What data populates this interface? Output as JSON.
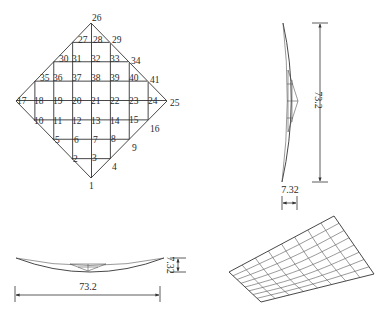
{
  "figure": {
    "plan_view": {
      "top": [
        91,
        23
      ],
      "bottom": [
        91,
        178
      ],
      "left": [
        16,
        101
      ],
      "right": [
        167,
        101
      ],
      "divisions": 8,
      "node_labels": [
        {
          "t": "1",
          "x": 89,
          "y": 189
        },
        {
          "t": "2",
          "x": 73,
          "y": 162
        },
        {
          "t": "3",
          "x": 92,
          "y": 161
        },
        {
          "t": "4",
          "x": 112,
          "y": 170
        },
        {
          "t": "5",
          "x": 55,
          "y": 143
        },
        {
          "t": "6",
          "x": 74,
          "y": 143
        },
        {
          "t": "7",
          "x": 93,
          "y": 143
        },
        {
          "t": "8",
          "x": 111,
          "y": 142
        },
        {
          "t": "9",
          "x": 132,
          "y": 151
        },
        {
          "t": "10",
          "x": 34,
          "y": 124
        },
        {
          "t": "11",
          "x": 53,
          "y": 124
        },
        {
          "t": "12",
          "x": 72,
          "y": 124
        },
        {
          "t": "13",
          "x": 91,
          "y": 124
        },
        {
          "t": "14",
          "x": 110,
          "y": 124
        },
        {
          "t": "15",
          "x": 129,
          "y": 123
        },
        {
          "t": "16",
          "x": 150,
          "y": 132
        },
        {
          "t": "17",
          "x": 17,
          "y": 104
        },
        {
          "t": "18",
          "x": 34,
          "y": 104
        },
        {
          "t": "19",
          "x": 53,
          "y": 104
        },
        {
          "t": "20",
          "x": 72,
          "y": 104
        },
        {
          "t": "21",
          "x": 91,
          "y": 104
        },
        {
          "t": "22",
          "x": 110,
          "y": 104
        },
        {
          "t": "23",
          "x": 129,
          "y": 104
        },
        {
          "t": "24",
          "x": 148,
          "y": 104
        },
        {
          "t": "25",
          "x": 170,
          "y": 106
        },
        {
          "t": "26",
          "x": 92,
          "y": 21
        },
        {
          "t": "27",
          "x": 78,
          "y": 43
        },
        {
          "t": "28",
          "x": 93,
          "y": 43
        },
        {
          "t": "29",
          "x": 112,
          "y": 43
        },
        {
          "t": "30",
          "x": 59,
          "y": 62
        },
        {
          "t": "31",
          "x": 72,
          "y": 62
        },
        {
          "t": "32",
          "x": 91,
          "y": 62
        },
        {
          "t": "33",
          "x": 110,
          "y": 62
        },
        {
          "t": "34",
          "x": 131,
          "y": 64
        },
        {
          "t": "35",
          "x": 40,
          "y": 81
        },
        {
          "t": "36",
          "x": 53,
          "y": 81
        },
        {
          "t": "37",
          "x": 72,
          "y": 81
        },
        {
          "t": "38",
          "x": 91,
          "y": 81
        },
        {
          "t": "39",
          "x": 110,
          "y": 81
        },
        {
          "t": "40",
          "x": 129,
          "y": 81
        },
        {
          "t": "41",
          "x": 150,
          "y": 83
        }
      ]
    },
    "side_view_vertical": {
      "dimension_height": "73.2",
      "dimension_depth": "7.32"
    },
    "side_view_horizontal": {
      "dimension_width": "73.2",
      "dimension_depth": "7.32"
    },
    "perspective_view": {
      "corners": {
        "top": [
          334,
          216
        ],
        "right": [
          374,
          274
        ],
        "bottom": [
          261,
          302
        ],
        "left": [
          229,
          272
        ]
      },
      "divisions": 8
    }
  }
}
